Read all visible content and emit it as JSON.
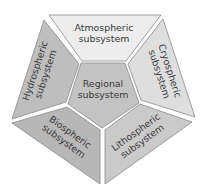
{
  "diagram": {
    "type": "pentagon-subsystems",
    "center": {
      "label_line1": "Regional",
      "label_line2": "subsystem",
      "color": "#c3c3c3"
    },
    "segments": [
      {
        "id": "atmospheric",
        "label_line1": "Atmospheric",
        "label_line2": "subsystem",
        "color": "#ededed",
        "position": "top"
      },
      {
        "id": "cryospheric",
        "label_line1": "Cryospheric",
        "label_line2": "subsystem",
        "color": "#dedede",
        "position": "upper-right"
      },
      {
        "id": "lithospheric",
        "label_line1": "Lithospheric",
        "label_line2": "subsystem",
        "color": "#cacaca",
        "position": "lower-right"
      },
      {
        "id": "biospheric",
        "label_line1": "Biospheric",
        "label_line2": "subsystem",
        "color": "#b7b7b7",
        "position": "lower-left"
      },
      {
        "id": "hydrospheric",
        "label_line1": "Hydrospheric",
        "label_line2": "subsystem",
        "color": "#bebebe",
        "position": "upper-left"
      }
    ],
    "stroke_color": "#8a8a8a",
    "gap_color": "#ffffff"
  }
}
